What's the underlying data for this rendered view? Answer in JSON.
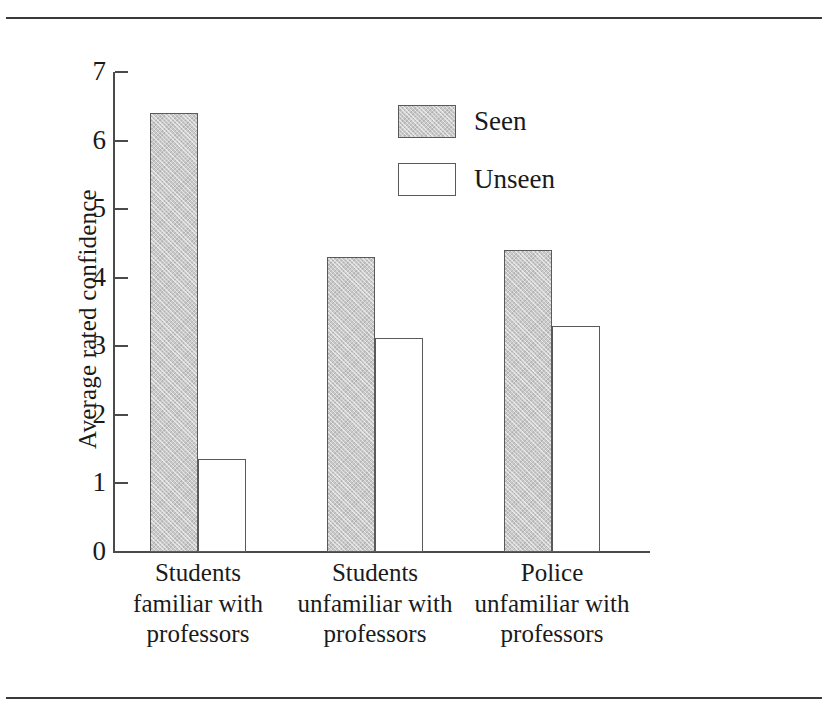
{
  "figure": {
    "background_color": "#ffffff",
    "rule_color": "#3a3a3a",
    "axis_color": "#4a4a4a"
  },
  "chart_data": {
    "type": "bar",
    "title": "",
    "subtitle": "",
    "xlabel": "",
    "ylabel": "Average rated confidence",
    "ylim": [
      0,
      7
    ],
    "yticks": [
      0,
      1,
      2,
      3,
      4,
      5,
      6,
      7
    ],
    "ytick_labels": [
      "0",
      "1",
      "2",
      "3",
      "4",
      "5",
      "6",
      "7"
    ],
    "grid": false,
    "legend_position": "upper center",
    "categories": [
      "Students familiar with professors",
      "Students unfamiliar with professors",
      "Police unfamiliar with professors"
    ],
    "category_lines": [
      [
        "Students",
        "familiar with",
        "professors"
      ],
      [
        "Students",
        "unfamiliar with",
        "professors"
      ],
      [
        "Police",
        "unfamiliar with",
        "professors"
      ]
    ],
    "series": [
      {
        "name": "Seen",
        "color": "#c9c9c9",
        "edge_color": "#5a5a5a",
        "fill": "stipple-gray",
        "values": [
          6.4,
          4.3,
          4.4
        ]
      },
      {
        "name": "Unseen",
        "color": "#ffffff",
        "edge_color": "#5a5a5a",
        "fill": "empty",
        "values": [
          1.35,
          3.12,
          3.29
        ]
      }
    ]
  },
  "legend": {
    "entries": [
      {
        "label": "Seen",
        "swatch": "filled-gray"
      },
      {
        "label": "Unseen",
        "swatch": "white"
      }
    ]
  }
}
